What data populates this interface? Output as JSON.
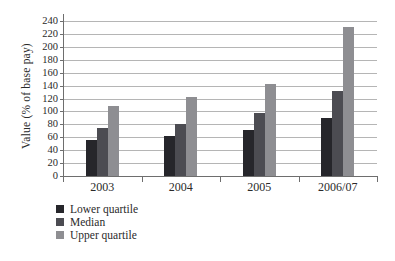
{
  "chart_data": {
    "type": "bar",
    "categories": [
      "2003",
      "2004",
      "2005",
      "2006/07"
    ],
    "series": [
      {
        "name": "Lower quartile",
        "color": "#26262b",
        "values": [
          55,
          62,
          72,
          90
        ]
      },
      {
        "name": "Median",
        "color": "#4c4c52",
        "values": [
          75,
          81,
          98,
          132
        ]
      },
      {
        "name": "Upper quartile",
        "color": "#8e8e92",
        "values": [
          108,
          123,
          143,
          230
        ]
      }
    ],
    "title": "",
    "xlabel": "",
    "ylabel": "Value (% of base pay)",
    "ylim": [
      0,
      240
    ],
    "ytick_step": 20,
    "grid": true,
    "legend_position": "bottom-left"
  }
}
